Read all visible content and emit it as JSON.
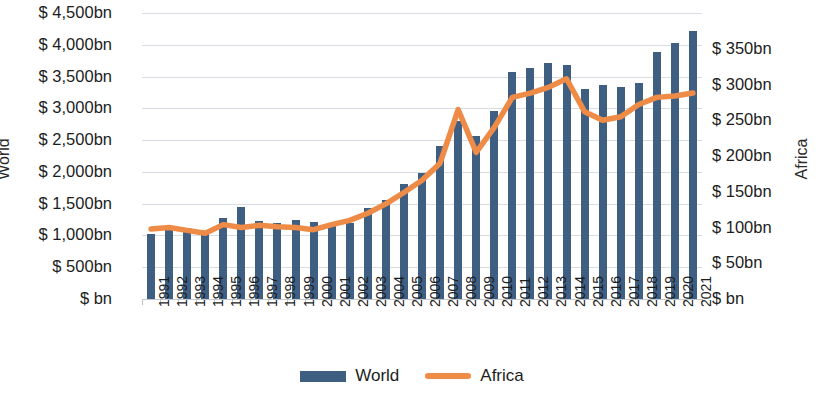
{
  "chart_data": {
    "type": "bar",
    "title": "",
    "xlabel": "",
    "categories": [
      "1991",
      "1992",
      "1993",
      "1994",
      "1995",
      "1996",
      "1997",
      "1998",
      "1999",
      "2000",
      "2001",
      "2002",
      "2003",
      "2004",
      "2005",
      "2006",
      "2007",
      "2008",
      "2009",
      "2010",
      "2011",
      "2012",
      "2013",
      "2014",
      "2015",
      "2016",
      "2017",
      "2018",
      "2019",
      "2020",
      "2021"
    ],
    "grid": true,
    "legend_position": "bottom",
    "series": [
      {
        "name": "World",
        "type": "bar",
        "color": "#3f5f82",
        "axis": "left",
        "unit": "bn",
        "currency": "$",
        "values": [
          1020,
          1080,
          1120,
          1020,
          1270,
          1440,
          1230,
          1200,
          1250,
          1210,
          1150,
          1200,
          1430,
          1560,
          1810,
          1980,
          2400,
          2800,
          2560,
          2960,
          3570,
          3630,
          3720,
          3680,
          3310,
          3360,
          3330,
          3400,
          3880,
          4030,
          4210
        ]
      },
      {
        "name": "Africa",
        "type": "line",
        "color": "#ed8b47",
        "axis": "right",
        "unit": "bn",
        "currency": "$",
        "values": [
          98,
          100,
          96,
          92,
          104,
          100,
          103,
          101,
          100,
          97,
          104,
          110,
          120,
          133,
          149,
          166,
          190,
          265,
          205,
          240,
          282,
          288,
          296,
          308,
          262,
          250,
          255,
          272,
          282,
          284,
          288
        ]
      }
    ],
    "y_left": {
      "title": "World",
      "min": 0,
      "max": 4500,
      "step": 500,
      "ticks": [
        "$ 4,500bn",
        "$ 4,000bn",
        "$ 3,500bn",
        "$ 3,000bn",
        "$ 2,500bn",
        "$ 2,000bn",
        "$ 1,500bn",
        "$ 1,000bn",
        "$ 500bn",
        "$ bn"
      ],
      "tick_values": [
        4500,
        4000,
        3500,
        3000,
        2500,
        2000,
        1500,
        1000,
        500,
        0
      ]
    },
    "y_right": {
      "title": "Africa",
      "min": 0,
      "max": 400,
      "step": 50,
      "ticks": [
        "$ 350bn",
        "$ 300bn",
        "$ 250bn",
        "$ 200bn",
        "$ 150bn",
        "$ 100bn",
        "$ 50bn",
        "$ bn"
      ],
      "tick_values": [
        350,
        300,
        250,
        200,
        150,
        100,
        50,
        0
      ]
    },
    "legend": [
      {
        "label": "World",
        "marker": "bar",
        "color": "#3f5f82"
      },
      {
        "label": "Africa",
        "marker": "line",
        "color": "#ed8b47"
      }
    ]
  }
}
